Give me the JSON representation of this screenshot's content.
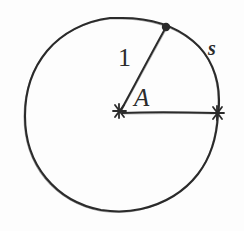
{
  "figure": {
    "background_color": "#fdfdfd",
    "ink_color": "#2b2b2b",
    "style": "hand-drawn pencil sketch"
  },
  "labels": {
    "radius": "1",
    "angle": "A",
    "arc": "s"
  },
  "markers": {
    "center_marker": "asterisk-marker",
    "arc_start_marker": "asterisk-marker",
    "arc_end_marker": "filled-dot-marker"
  },
  "geometry": {
    "circle": {
      "center_x": 122,
      "center_y": 114,
      "radius": 97
    },
    "center_point": {
      "x": 121,
      "y": 111
    },
    "arc_start_point": {
      "x": 218,
      "y": 113
    },
    "arc_end_point": {
      "x": 166,
      "y": 27
    },
    "radius_label_position": {
      "x": 128,
      "y": 62
    },
    "angle_label_position": {
      "x": 144,
      "y": 100
    },
    "arc_label_position": {
      "x": 214,
      "y": 49
    }
  }
}
